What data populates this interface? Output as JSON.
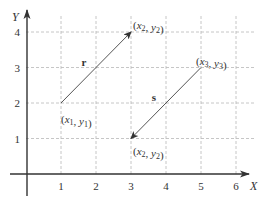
{
  "diagram": {
    "axes": {
      "x_label": "X",
      "y_label": "Y",
      "x_ticks": [
        "1",
        "2",
        "3",
        "4",
        "5",
        "6"
      ],
      "y_ticks": [
        "1",
        "2",
        "3",
        "4"
      ],
      "x_range": [
        0,
        6.5
      ],
      "y_range": [
        0,
        4.5
      ]
    },
    "vectors": [
      {
        "name": "r",
        "label": "r",
        "from": [
          1,
          2
        ],
        "to": [
          3,
          4
        ]
      },
      {
        "name": "s",
        "label": "s",
        "from": [
          5,
          3
        ],
        "to": [
          3,
          1
        ]
      }
    ],
    "point_labels": [
      {
        "text": "(x1, y1)",
        "base1": "x",
        "sub1": "1",
        "base2": "y",
        "sub2": "1",
        "at": [
          1,
          2
        ]
      },
      {
        "text": "(x2, y2)",
        "base1": "x",
        "sub1": "2",
        "base2": "y",
        "sub2": "2",
        "at": [
          3,
          4
        ]
      },
      {
        "text": "(x3, y3)",
        "base1": "x",
        "sub1": "3",
        "base2": "y",
        "sub2": "3",
        "at": [
          5,
          3
        ]
      },
      {
        "text": "(x2, y2)",
        "base1": "x",
        "sub1": "2",
        "base2": "y",
        "sub2": "2",
        "at": [
          3,
          1
        ]
      }
    ],
    "colors": {
      "axis": "#333333",
      "grid": "#b8b8b8",
      "vector": "#555555"
    }
  }
}
